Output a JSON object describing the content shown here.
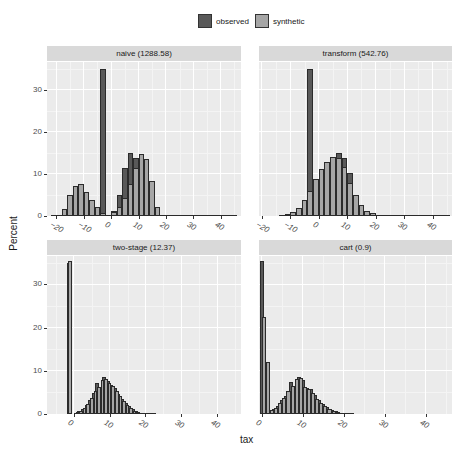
{
  "legend": {
    "items": [
      {
        "label": "observed",
        "color": "#595959"
      },
      {
        "label": "synthetic",
        "color": "#a6a6a6"
      }
    ]
  },
  "axes": {
    "xlabel": "tax",
    "ylabel": "Percent"
  },
  "chart_data": [
    {
      "type": "bar",
      "title": "naive (1288.58)",
      "xlabel": "tax",
      "ylabel": "Percent",
      "xlim": [
        -23.4,
        47.4
      ],
      "ylim": [
        0,
        36.6
      ],
      "xticks": [
        -20,
        -10,
        0,
        10,
        20,
        30,
        40
      ],
      "yticks": [
        0,
        10,
        20,
        30
      ],
      "bin_width": 2,
      "series": [
        {
          "name": "observed",
          "x": [
            -3,
            -1,
            1,
            3,
            5,
            7,
            9,
            11,
            13,
            15,
            17,
            19,
            21,
            23,
            25,
            27,
            29,
            31,
            33,
            35,
            37,
            39,
            41,
            43,
            45
          ],
          "values": [
            35,
            0,
            1.2,
            4.9,
            11.4,
            14.9,
            13.7,
            10.3,
            4.9,
            2.0,
            0.6,
            0.3,
            0.1,
            0.1,
            0.05,
            0.05,
            0.05,
            0.05,
            0.05,
            0.05,
            0.05,
            0.05,
            0.05,
            0.05,
            0.05
          ]
        },
        {
          "name": "synthetic",
          "x": [
            -21,
            -19,
            -17,
            -15,
            -13,
            -11,
            -9,
            -7,
            -5,
            -3,
            -1,
            1,
            3,
            5,
            7,
            9,
            11,
            13,
            15,
            17,
            19,
            21
          ],
          "values": [
            0.05,
            0.3,
            1.7,
            4.9,
            7.1,
            7.5,
            5.8,
            3.9,
            2.1,
            0.8,
            0,
            0.9,
            2.1,
            4.3,
            7.7,
            11.4,
            14.7,
            13.5,
            8.3,
            2.2,
            0.2,
            0.05
          ]
        }
      ]
    },
    {
      "type": "bar",
      "title": "transform (542.76)",
      "xlabel": "tax",
      "ylabel": "Percent",
      "xlim": [
        -21,
        46.8
      ],
      "ylim": [
        0,
        36.6
      ],
      "xticks": [
        -20,
        -10,
        0,
        10,
        20,
        30,
        40
      ],
      "yticks": [
        0,
        10,
        20,
        30
      ],
      "bin_width": 2,
      "series": [
        {
          "name": "observed",
          "x": [
            -3,
            -1,
            1,
            3,
            5,
            7,
            9,
            11,
            13,
            15,
            17,
            19,
            21,
            23,
            25,
            27,
            29,
            31,
            33,
            35,
            37,
            39,
            41,
            43,
            45
          ],
          "values": [
            35,
            0,
            1.3,
            5.1,
            11.4,
            14.9,
            13.7,
            10.3,
            5.0,
            2.0,
            0.7,
            0.3,
            0.1,
            0.1,
            0.05,
            0.05,
            0.05,
            0.05,
            0.05,
            0.05,
            0.05,
            0.05,
            0.05,
            0.05,
            0.05
          ]
        },
        {
          "name": "synthetic",
          "x": [
            -13,
            -11,
            -9,
            -7,
            -5,
            -3,
            -1,
            1,
            3,
            5,
            7,
            9,
            11,
            13,
            15,
            17,
            19,
            21,
            23
          ],
          "values": [
            0.1,
            0.4,
            0.9,
            1.8,
            3.8,
            6.0,
            8.8,
            11.2,
            12.8,
            14.0,
            13.7,
            11.7,
            7.9,
            5.0,
            2.7,
            1.3,
            0.6,
            0.3,
            0.1
          ]
        }
      ]
    },
    {
      "type": "bar",
      "title": "two-stage (12.37)",
      "xlabel": "tax",
      "ylabel": "Percent",
      "xlim": [
        -7.5,
        46.7
      ],
      "ylim": [
        0,
        36.6
      ],
      "xticks": [
        0,
        10,
        20,
        30,
        40
      ],
      "yticks": [
        0,
        10,
        20,
        30
      ],
      "bin_width": 1,
      "series": [
        {
          "name": "observed",
          "x": [
            -1.5,
            0.5,
            1.5,
            2.5,
            3.5,
            4.5,
            5.5,
            6.5,
            7.5,
            8.5,
            9.5,
            10.5,
            11.5,
            12.5,
            13.5,
            14.5,
            15.5,
            16.5,
            17.5,
            18.5,
            19.5,
            20.5,
            21.5,
            22.5
          ],
          "values": [
            35,
            0.3,
            0.6,
            1.2,
            2.0,
            3.2,
            4.8,
            7.2,
            6.0,
            8.5,
            7.6,
            6.8,
            6.0,
            4.7,
            3.5,
            2.6,
            1.8,
            1.1,
            0.6,
            0.3,
            0.2,
            0.1,
            0.1,
            0.05
          ]
        },
        {
          "name": "synthetic",
          "x": [
            -1,
            1,
            2,
            3,
            4,
            5,
            6,
            7,
            8,
            9,
            10,
            11,
            12,
            13,
            14,
            15,
            16,
            17,
            18,
            19,
            20,
            21
          ],
          "values": [
            35.5,
            0.4,
            0.8,
            1.5,
            2.4,
            3.8,
            5.3,
            6.3,
            7.8,
            8.0,
            7.2,
            6.4,
            5.4,
            4.2,
            3.1,
            2.2,
            1.4,
            0.8,
            0.4,
            0.2,
            0.1,
            0.05
          ]
        }
      ]
    },
    {
      "type": "bar",
      "title": "cart (0.9)",
      "xlabel": "tax",
      "ylabel": "Percent",
      "xlim": [
        -0.7,
        46.4
      ],
      "ylim": [
        0,
        36.6
      ],
      "xticks": [
        0,
        10,
        20,
        30,
        40
      ],
      "yticks": [
        0,
        10,
        20,
        30
      ],
      "bin_width": 1,
      "series": [
        {
          "name": "observed",
          "x": [
            0,
            2,
            3,
            4,
            5,
            6,
            7,
            8,
            9,
            10,
            11,
            12,
            13,
            14,
            15,
            16,
            17,
            18,
            19,
            20,
            21,
            22
          ],
          "values": [
            35.5,
            1.0,
            1.1,
            1.8,
            3.3,
            4.2,
            7.4,
            6.4,
            8.6,
            7.9,
            6.0,
            5.7,
            4.5,
            3.2,
            2.4,
            1.7,
            1.0,
            0.6,
            0.3,
            0.2,
            0.1,
            0.05
          ]
        },
        {
          "name": "synthetic",
          "x": [
            0.5,
            1.5,
            2.5,
            3.5,
            4.5,
            5.5,
            6.5,
            7.5,
            8.5,
            9.5,
            10.5,
            11.5,
            12.5,
            13.5,
            14.5,
            15.5,
            16.5,
            17.5,
            18.5,
            19.5,
            20.5
          ],
          "values": [
            22.5,
            12.0,
            0.9,
            1.5,
            2.6,
            3.6,
            5.3,
            6.6,
            8.0,
            8.4,
            6.2,
            5.9,
            4.8,
            3.4,
            2.6,
            1.8,
            1.1,
            0.7,
            0.4,
            0.2,
            0.1
          ]
        }
      ]
    }
  ]
}
